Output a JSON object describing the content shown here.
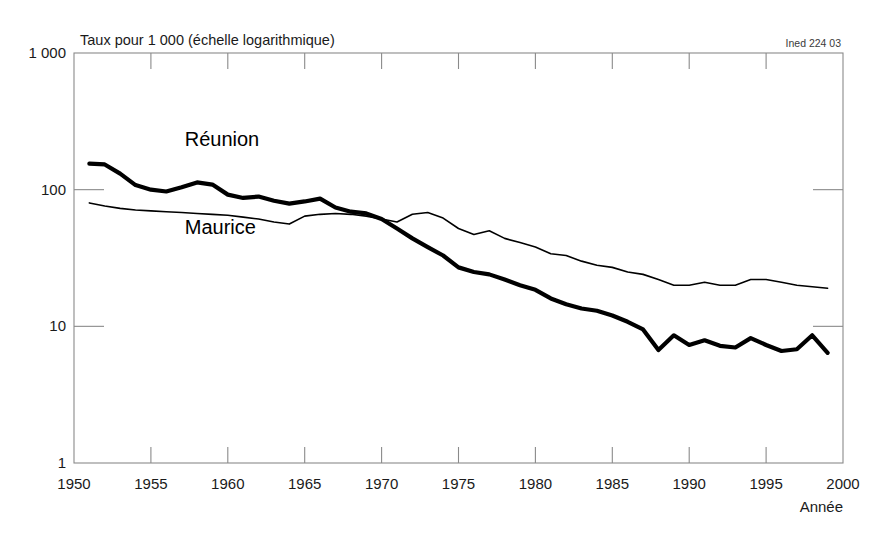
{
  "figure": {
    "source_tag": "Ined 224 03",
    "background_color": "#ffffff",
    "frame_color": "#8a8a8a",
    "line_color": "#000000"
  },
  "chart_data": {
    "type": "line",
    "title": "Taux pour 1 000 (échelle logarithmique)",
    "xlabel": "Année",
    "ylabel": "",
    "yscale": "log",
    "ylim": [
      1,
      1000
    ],
    "xlim": [
      1950,
      2000
    ],
    "grid": false,
    "legend": "inline-labels",
    "ytick_labels": [
      "1 000",
      "100",
      "10",
      "1"
    ],
    "ytick_values": [
      1000,
      100,
      10,
      1
    ],
    "xtick_labels": [
      "1950",
      "1955",
      "1960",
      "1965",
      "1970",
      "1975",
      "1980",
      "1985",
      "1990",
      "1995",
      "2000"
    ],
    "xtick_values": [
      1950,
      1955,
      1960,
      1965,
      1970,
      1975,
      1980,
      1985,
      1990,
      1995,
      2000
    ],
    "series": [
      {
        "name": "Réunion",
        "style": "thick",
        "stroke_width": 4.2,
        "label_x": 1957.2,
        "label_y": 210,
        "x": [
          1951,
          1952,
          1953,
          1954,
          1955,
          1956,
          1957,
          1958,
          1959,
          1960,
          1961,
          1962,
          1963,
          1964,
          1965,
          1966,
          1967,
          1968,
          1969,
          1970,
          1971,
          1972,
          1973,
          1974,
          1975,
          1976,
          1977,
          1978,
          1979,
          1980,
          1981,
          1982,
          1983,
          1984,
          1985,
          1986,
          1987,
          1988,
          1989,
          1990,
          1991,
          1992,
          1993,
          1994,
          1995,
          1996,
          1997,
          1998,
          1999
        ],
        "values": [
          155,
          153,
          131,
          108,
          100,
          97,
          104,
          113,
          109,
          92,
          87,
          89,
          83,
          79,
          82,
          86,
          74,
          69,
          67,
          61,
          52,
          44,
          38,
          33,
          27,
          25,
          24,
          22,
          20,
          18.5,
          16,
          14.5,
          13.5,
          13,
          12,
          10.8,
          9.5,
          6.7,
          8.6,
          7.3,
          7.9,
          7.2,
          7.0,
          8.2,
          7.3,
          6.6,
          6.8,
          8.6,
          6.4
        ]
      },
      {
        "name": "Maurice",
        "style": "thin",
        "stroke_width": 1.6,
        "label_x": 1957.2,
        "label_y": 47,
        "x": [
          1951,
          1952,
          1953,
          1954,
          1955,
          1956,
          1957,
          1958,
          1959,
          1960,
          1961,
          1962,
          1963,
          1964,
          1965,
          1966,
          1967,
          1968,
          1969,
          1970,
          1971,
          1972,
          1973,
          1974,
          1975,
          1976,
          1977,
          1978,
          1979,
          1980,
          1981,
          1982,
          1983,
          1984,
          1985,
          1986,
          1987,
          1988,
          1989,
          1990,
          1991,
          1992,
          1993,
          1994,
          1995,
          1996,
          1997,
          1998,
          1999
        ],
        "values": [
          80,
          76,
          73,
          71,
          70,
          69,
          68,
          67,
          66,
          65,
          63,
          61,
          58,
          56,
          64,
          66,
          67,
          66,
          64,
          61,
          58,
          66,
          68,
          62,
          52,
          47,
          50,
          44,
          41,
          38,
          34,
          33,
          30,
          28,
          27,
          25,
          24,
          22,
          20,
          20,
          21,
          20,
          20,
          22,
          22,
          21,
          20,
          19.5,
          19
        ]
      }
    ]
  }
}
